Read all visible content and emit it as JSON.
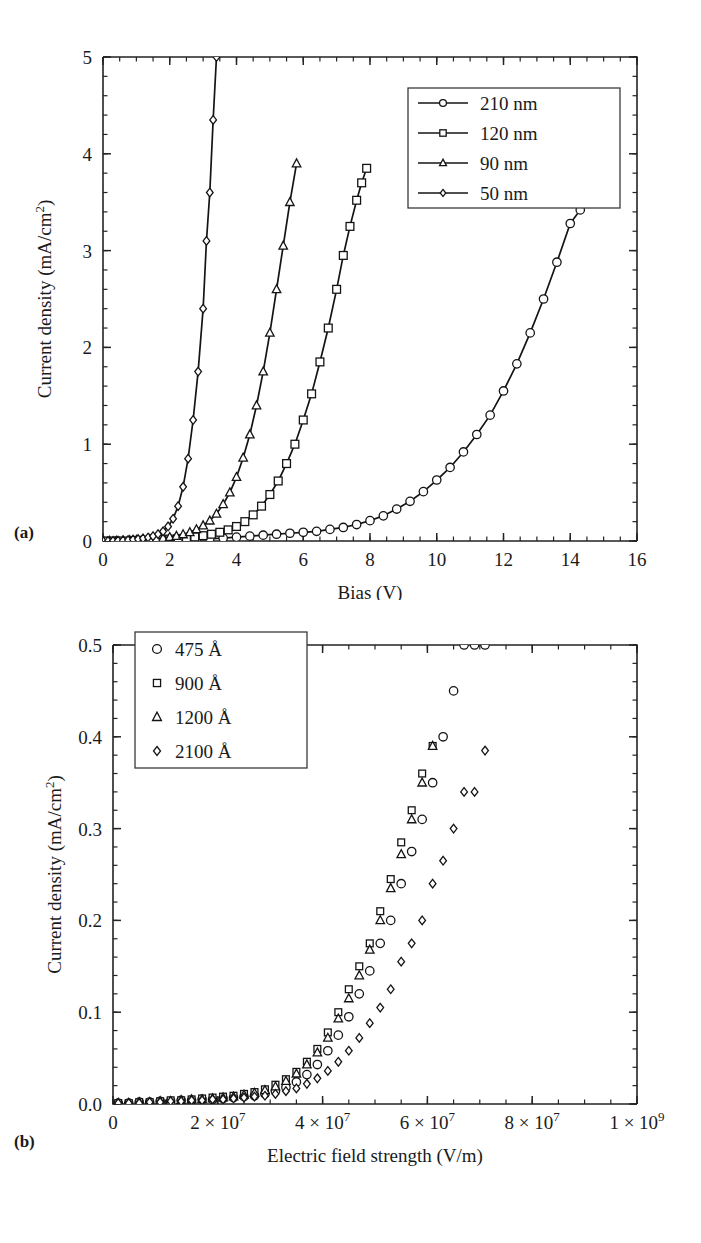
{
  "figure": {
    "panel_a_label": "(a)",
    "panel_b_label": "(b)"
  },
  "chart_data": [
    {
      "id": "panel-a",
      "type": "line",
      "title": "",
      "xlabel": "Bias (V)",
      "ylabel": "Current density (mA/cm2)",
      "ylabel_base": "Current density (mA/cm",
      "ylabel_sup": "2",
      "ylabel_tail": ")",
      "xlim": [
        0,
        16
      ],
      "ylim": [
        0,
        5
      ],
      "xticks": [
        0,
        2,
        4,
        6,
        8,
        10,
        12,
        14,
        16
      ],
      "xtick_labels": [
        "0",
        "2",
        "4",
        "6",
        "8",
        "10",
        "12",
        "14",
        "16"
      ],
      "xminor_step": 0.5,
      "yticks": [
        0,
        1,
        2,
        3,
        4,
        5
      ],
      "ytick_labels": [
        "0",
        "1",
        "2",
        "3",
        "4",
        "5"
      ],
      "yminor_step": 0.2,
      "grid": false,
      "legend_position": "top-right",
      "series": [
        {
          "name": "210 nm",
          "marker": "circle",
          "line": true,
          "x": [
            0.0,
            0.4,
            0.8,
            1.2,
            1.6,
            2.0,
            2.4,
            2.8,
            3.2,
            3.6,
            4.0,
            4.4,
            4.8,
            5.2,
            5.6,
            6.0,
            6.4,
            6.8,
            7.2,
            7.6,
            8.0,
            8.4,
            8.8,
            9.2,
            9.6,
            10.0,
            10.4,
            10.8,
            11.2,
            11.6,
            12.0,
            12.4,
            12.8,
            13.2,
            13.6,
            14.0,
            14.3,
            14.6,
            14.9
          ],
          "y": [
            0.0,
            0.0,
            0.0,
            0.0,
            0.005,
            0.01,
            0.015,
            0.02,
            0.025,
            0.03,
            0.04,
            0.05,
            0.06,
            0.07,
            0.08,
            0.09,
            0.1,
            0.12,
            0.14,
            0.17,
            0.21,
            0.26,
            0.33,
            0.41,
            0.51,
            0.63,
            0.76,
            0.92,
            1.1,
            1.3,
            1.55,
            1.83,
            2.15,
            2.5,
            2.88,
            3.28,
            3.42,
            3.65,
            3.87
          ]
        },
        {
          "name": "120 nm",
          "marker": "square",
          "line": true,
          "x": [
            0.0,
            0.25,
            0.5,
            0.75,
            1.0,
            1.25,
            1.5,
            1.75,
            2.0,
            2.25,
            2.5,
            2.75,
            3.0,
            3.25,
            3.5,
            3.75,
            4.0,
            4.25,
            4.5,
            4.75,
            5.0,
            5.25,
            5.5,
            5.75,
            6.0,
            6.25,
            6.5,
            6.75,
            7.0,
            7.2,
            7.4,
            7.6,
            7.75,
            7.9
          ],
          "y": [
            0.0,
            0.0,
            0.0,
            0.0,
            0.005,
            0.008,
            0.012,
            0.016,
            0.02,
            0.026,
            0.033,
            0.042,
            0.055,
            0.07,
            0.09,
            0.115,
            0.15,
            0.2,
            0.27,
            0.36,
            0.48,
            0.62,
            0.8,
            1.0,
            1.25,
            1.52,
            1.85,
            2.2,
            2.6,
            2.95,
            3.25,
            3.52,
            3.7,
            3.85
          ]
        },
        {
          "name": "90 nm",
          "marker": "triangle",
          "line": true,
          "x": [
            0.0,
            0.2,
            0.4,
            0.6,
            0.8,
            1.0,
            1.2,
            1.4,
            1.6,
            1.8,
            2.0,
            2.2,
            2.4,
            2.6,
            2.8,
            3.0,
            3.2,
            3.4,
            3.6,
            3.8,
            4.0,
            4.2,
            4.4,
            4.6,
            4.8,
            5.0,
            5.2,
            5.4,
            5.6,
            5.8
          ],
          "y": [
            0.0,
            0.0,
            0.0,
            0.004,
            0.007,
            0.01,
            0.014,
            0.018,
            0.023,
            0.03,
            0.04,
            0.052,
            0.068,
            0.09,
            0.12,
            0.16,
            0.21,
            0.28,
            0.38,
            0.5,
            0.66,
            0.86,
            1.1,
            1.4,
            1.75,
            2.15,
            2.6,
            3.05,
            3.5,
            3.9
          ]
        },
        {
          "name": "50 nm",
          "marker": "diamond",
          "line": true,
          "x": [
            0.0,
            0.15,
            0.3,
            0.45,
            0.6,
            0.75,
            0.9,
            1.05,
            1.2,
            1.35,
            1.5,
            1.65,
            1.8,
            1.95,
            2.1,
            2.25,
            2.4,
            2.55,
            2.7,
            2.85,
            3.0,
            3.1,
            3.2,
            3.3,
            3.4
          ],
          "y": [
            0.0,
            0.0,
            0.002,
            0.004,
            0.007,
            0.01,
            0.015,
            0.02,
            0.027,
            0.036,
            0.05,
            0.07,
            0.1,
            0.15,
            0.23,
            0.36,
            0.56,
            0.85,
            1.25,
            1.75,
            2.4,
            3.1,
            3.6,
            4.35,
            5.0
          ]
        }
      ]
    },
    {
      "id": "panel-b",
      "type": "scatter",
      "title": "",
      "xlabel": "Electric field strength (V/m)",
      "ylabel": "Current density (mA/cm2)",
      "ylabel_base": "Current density (mA/cm",
      "ylabel_sup": "2",
      "ylabel_tail": ")",
      "xlim": [
        0,
        100000000
      ],
      "ylim": [
        0,
        0.5
      ],
      "xticks": [
        0,
        20000000,
        40000000,
        60000000,
        80000000,
        100000000
      ],
      "xtick_labels": [
        "0",
        "2 × 10",
        "4 × 10",
        "6 × 10",
        "8 × 10",
        "1 × 10"
      ],
      "xtick_exponents": [
        "",
        "7",
        "7",
        "7",
        "7",
        "9"
      ],
      "xminor_step": 5000000,
      "yticks": [
        0.0,
        0.1,
        0.2,
        0.3,
        0.4,
        0.5
      ],
      "ytick_labels": [
        "0.0",
        "0.1",
        "0.2",
        "0.3",
        "0.4",
        "0.5"
      ],
      "yminor_step": 0.02,
      "grid": false,
      "legend_position": "top-left",
      "series": [
        {
          "name": "475 Å",
          "marker": "circle",
          "line": false,
          "x": [
            1000000,
            3000000,
            5000000,
            7000000,
            9000000,
            11000000,
            13000000,
            15000000,
            17000000,
            19000000,
            21000000,
            23000000,
            25000000,
            27000000,
            29000000,
            31000000,
            33000000,
            35000000,
            37000000,
            39000000,
            41000000,
            43000000,
            45000000,
            47000000,
            49000000,
            51000000,
            53000000,
            55000000,
            57000000,
            59000000,
            61000000,
            63000000,
            65000000,
            67000000,
            69000000,
            71000000
          ],
          "y": [
            0.001,
            0.001,
            0.002,
            0.002,
            0.003,
            0.003,
            0.004,
            0.004,
            0.005,
            0.005,
            0.006,
            0.007,
            0.008,
            0.009,
            0.011,
            0.014,
            0.018,
            0.024,
            0.032,
            0.043,
            0.058,
            0.075,
            0.095,
            0.12,
            0.145,
            0.175,
            0.2,
            0.24,
            0.275,
            0.31,
            0.35,
            0.4,
            0.45,
            0.5,
            0.5,
            0.5
          ]
        },
        {
          "name": "900 Å",
          "marker": "square-small",
          "line": false,
          "x": [
            1000000,
            3000000,
            5000000,
            7000000,
            9000000,
            11000000,
            13000000,
            15000000,
            17000000,
            19000000,
            21000000,
            23000000,
            25000000,
            27000000,
            29000000,
            31000000,
            33000000,
            35000000,
            37000000,
            39000000,
            41000000,
            43000000,
            45000000,
            47000000,
            49000000,
            51000000,
            53000000,
            55000000,
            57000000,
            59000000,
            61000000
          ],
          "y": [
            0.001,
            0.001,
            0.002,
            0.002,
            0.003,
            0.004,
            0.004,
            0.005,
            0.006,
            0.007,
            0.008,
            0.009,
            0.011,
            0.013,
            0.016,
            0.021,
            0.027,
            0.035,
            0.046,
            0.06,
            0.078,
            0.1,
            0.125,
            0.15,
            0.175,
            0.21,
            0.245,
            0.285,
            0.32,
            0.36,
            0.39
          ]
        },
        {
          "name": "1200 Å",
          "marker": "triangle",
          "line": false,
          "x": [
            1000000,
            3000000,
            5000000,
            7000000,
            9000000,
            11000000,
            13000000,
            15000000,
            17000000,
            19000000,
            21000000,
            23000000,
            25000000,
            27000000,
            29000000,
            31000000,
            33000000,
            35000000,
            37000000,
            39000000,
            41000000,
            43000000,
            45000000,
            47000000,
            49000000,
            51000000,
            53000000,
            55000000,
            57000000,
            59000000,
            61000000
          ],
          "y": [
            0.001,
            0.001,
            0.002,
            0.002,
            0.003,
            0.003,
            0.004,
            0.005,
            0.005,
            0.006,
            0.007,
            0.008,
            0.01,
            0.012,
            0.015,
            0.019,
            0.025,
            0.033,
            0.043,
            0.056,
            0.072,
            0.093,
            0.115,
            0.14,
            0.168,
            0.2,
            0.235,
            0.272,
            0.31,
            0.35,
            0.39
          ]
        },
        {
          "name": "2100 Å",
          "marker": "diamond",
          "line": false,
          "x": [
            1000000,
            3000000,
            5000000,
            7000000,
            9000000,
            11000000,
            13000000,
            15000000,
            17000000,
            19000000,
            21000000,
            23000000,
            25000000,
            27000000,
            29000000,
            31000000,
            33000000,
            35000000,
            37000000,
            39000000,
            41000000,
            43000000,
            45000000,
            47000000,
            49000000,
            51000000,
            53000000,
            55000000,
            57000000,
            59000000,
            61000000,
            63000000,
            65000000,
            67000000,
            69000000,
            71000000
          ],
          "y": [
            0.001,
            0.001,
            0.001,
            0.002,
            0.002,
            0.003,
            0.003,
            0.004,
            0.004,
            0.005,
            0.005,
            0.006,
            0.007,
            0.008,
            0.009,
            0.011,
            0.014,
            0.017,
            0.022,
            0.028,
            0.036,
            0.046,
            0.058,
            0.072,
            0.088,
            0.105,
            0.125,
            0.155,
            0.175,
            0.2,
            0.24,
            0.265,
            0.3,
            0.34,
            0.34,
            0.385
          ]
        }
      ]
    }
  ]
}
